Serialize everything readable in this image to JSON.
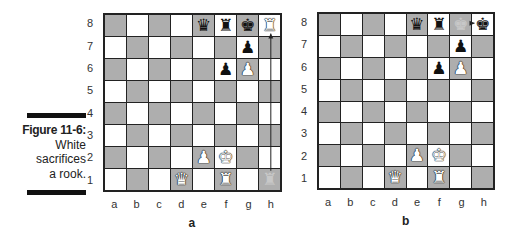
{
  "caption": {
    "figure_label": "Figure 11-6:",
    "lines": [
      "White",
      "sacrifices",
      "a rook."
    ]
  },
  "ranks": [
    "8",
    "7",
    "6",
    "5",
    "4",
    "3",
    "2",
    "1"
  ],
  "files": [
    "a",
    "b",
    "c",
    "d",
    "e",
    "f",
    "g",
    "h"
  ],
  "colors": {
    "light_square": "#ffffff",
    "dark_square": "#aeaeae",
    "border": "#222222"
  },
  "boards": [
    {
      "id": "a",
      "sub_caption": "a",
      "pieces": [
        {
          "square": "e8",
          "glyph": "♛",
          "color": "black",
          "name": "black-queen"
        },
        {
          "square": "f8",
          "glyph": "♜",
          "color": "black",
          "name": "black-rook"
        },
        {
          "square": "g8",
          "glyph": "♚",
          "color": "black",
          "name": "black-king"
        },
        {
          "square": "h8",
          "glyph": "♜",
          "color": "white",
          "name": "white-rook"
        },
        {
          "square": "g7",
          "glyph": "♟",
          "color": "black",
          "name": "black-pawn"
        },
        {
          "square": "f6",
          "glyph": "♟",
          "color": "black",
          "name": "black-pawn"
        },
        {
          "square": "g6",
          "glyph": "♟",
          "color": "white",
          "name": "white-pawn"
        },
        {
          "square": "e2",
          "glyph": "♟",
          "color": "white",
          "name": "white-pawn"
        },
        {
          "square": "f2",
          "glyph": "♚",
          "color": "white",
          "name": "white-king"
        },
        {
          "square": "d1",
          "glyph": "♛",
          "color": "white",
          "name": "white-queen"
        },
        {
          "square": "f1",
          "glyph": "♜",
          "color": "white",
          "name": "white-rook"
        },
        {
          "square": "h1",
          "glyph": "♜",
          "color": "faded",
          "name": "faded-rook-origin"
        }
      ],
      "move_arrow": {
        "from": "h1",
        "to": "h8",
        "label": "Rh1-h8"
      }
    },
    {
      "id": "b",
      "sub_caption": "b",
      "pieces": [
        {
          "square": "e8",
          "glyph": "♛",
          "color": "black",
          "name": "black-queen"
        },
        {
          "square": "f8",
          "glyph": "♜",
          "color": "black",
          "name": "black-rook"
        },
        {
          "square": "g8",
          "glyph": "♚",
          "color": "faded",
          "name": "faded-king-origin"
        },
        {
          "square": "h8",
          "glyph": "♚",
          "color": "black",
          "name": "black-king"
        },
        {
          "square": "g7",
          "glyph": "♟",
          "color": "black",
          "name": "black-pawn"
        },
        {
          "square": "f6",
          "glyph": "♟",
          "color": "black",
          "name": "black-pawn"
        },
        {
          "square": "g6",
          "glyph": "♟",
          "color": "white",
          "name": "white-pawn"
        },
        {
          "square": "e2",
          "glyph": "♟",
          "color": "white",
          "name": "white-pawn"
        },
        {
          "square": "f2",
          "glyph": "♚",
          "color": "white",
          "name": "white-king"
        },
        {
          "square": "d1",
          "glyph": "♛",
          "color": "white",
          "name": "white-queen"
        },
        {
          "square": "f1",
          "glyph": "♜",
          "color": "white",
          "name": "white-rook"
        }
      ],
      "move_arrow": {
        "from": "g8",
        "to": "h8",
        "label": "Kxh8"
      }
    }
  ]
}
